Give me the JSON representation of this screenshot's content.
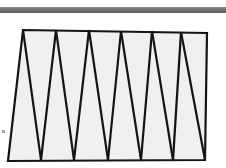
{
  "figure": {
    "canvas": {
      "width": 226,
      "height": 168,
      "background": "#ffffff"
    },
    "colors": {
      "rule_gray": "#6e6e6e",
      "rule_gray_highlight": "#8c8c8c",
      "strip_fill": "#f0f0f0",
      "stroke_black": "#141414",
      "speck_gray": "#a8a8a8"
    },
    "rule": {
      "name": "horizontal-gray-bar",
      "x": 0,
      "y": 7,
      "width": 226,
      "height": 6,
      "label": ""
    },
    "strip": {
      "name": "triangle-strip",
      "outline_points": "23,30 207,33 205,160 8,161",
      "fill": "#f0f0f0",
      "stroke_width": 2.2,
      "top_vertices": [
        {
          "id": "T0",
          "x": 23,
          "y": 30
        },
        {
          "id": "T1",
          "x": 56,
          "y": 30
        },
        {
          "id": "T2",
          "x": 89,
          "y": 30
        },
        {
          "id": "T3",
          "x": 121,
          "y": 31
        },
        {
          "id": "T4",
          "x": 152,
          "y": 31
        },
        {
          "id": "T5",
          "x": 181,
          "y": 32
        },
        {
          "id": "T6",
          "x": 207,
          "y": 33
        }
      ],
      "bottom_vertices": [
        {
          "id": "B0",
          "x": 8,
          "y": 161
        },
        {
          "id": "B1",
          "x": 41,
          "y": 160
        },
        {
          "id": "B2",
          "x": 74,
          "y": 160
        },
        {
          "id": "B3",
          "x": 108,
          "y": 160
        },
        {
          "id": "B4",
          "x": 141,
          "y": 160
        },
        {
          "id": "B5",
          "x": 173,
          "y": 160
        },
        {
          "id": "B6",
          "x": 205,
          "y": 160
        }
      ],
      "diagonals": [
        {
          "id": "D0",
          "from": "23,30",
          "to": "41,160"
        },
        {
          "id": "D1",
          "from": "56,30",
          "to": "41,160"
        },
        {
          "id": "D2",
          "from": "56,30",
          "to": "74,160"
        },
        {
          "id": "D3",
          "from": "89,30",
          "to": "74,160"
        },
        {
          "id": "D4",
          "from": "89,30",
          "to": "108,160"
        },
        {
          "id": "D5",
          "from": "121,31",
          "to": "108,160"
        },
        {
          "id": "D6",
          "from": "121,31",
          "to": "141,160"
        },
        {
          "id": "D7",
          "from": "152,31",
          "to": "141,160"
        },
        {
          "id": "D8",
          "from": "152,31",
          "to": "173,160"
        },
        {
          "id": "D9",
          "from": "181,32",
          "to": "173,160"
        },
        {
          "id": "D10",
          "from": "181,32",
          "to": "205,160"
        }
      ],
      "triangle_count": 12
    },
    "speck": {
      "name": "edge-speck-mark",
      "x": 2,
      "y": 130,
      "width": 3,
      "height": 3
    }
  }
}
